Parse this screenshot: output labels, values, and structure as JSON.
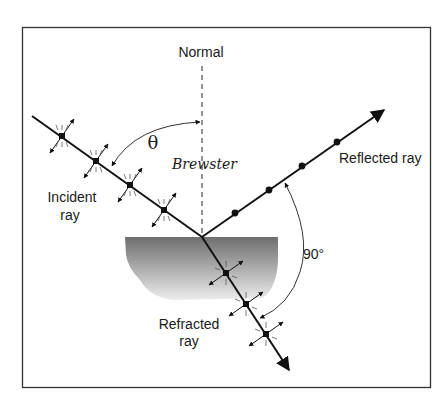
{
  "diagram": {
    "labels": {
      "normal": "Normal",
      "theta": "θ",
      "brewster": "Brewster",
      "incident_line1": "Incident",
      "incident_line2": "ray",
      "reflected": "Reflected ray",
      "refracted_line1": "Refracted",
      "refracted_line2": "ray",
      "right_angle": "90°"
    },
    "colors": {
      "ink": "#111111",
      "frame": "#333333",
      "medium_top": "#6e6e6e",
      "medium_bottom": "#e6e6e6"
    },
    "elements": [
      {
        "id": "normal-line",
        "type": "dashed vertical line"
      },
      {
        "id": "incident-ray",
        "polarization": "both (dots + arrows)"
      },
      {
        "id": "reflected-ray",
        "polarization": "perpendicular only (dots)"
      },
      {
        "id": "refracted-ray",
        "polarization": "both (dots + arrows)"
      },
      {
        "id": "theta-arc",
        "meaning": "Brewster angle between incident ray and normal"
      },
      {
        "id": "right-angle-arc",
        "meaning": "90° between reflected and refracted rays"
      },
      {
        "id": "medium-surface",
        "meaning": "dielectric medium"
      }
    ]
  }
}
